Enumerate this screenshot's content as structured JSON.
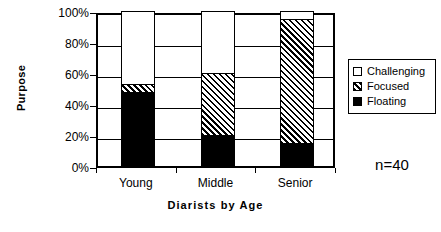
{
  "chart_data": {
    "type": "bar",
    "subtype": "stacked-100-percent",
    "title": "",
    "xlabel": "Diarists by Age",
    "ylabel": "Purpose",
    "categories": [
      "Young",
      "Middle",
      "Senior"
    ],
    "series": [
      {
        "name": "Floating",
        "values": [
          48,
          20,
          15
        ],
        "fill": "solid"
      },
      {
        "name": "Focused",
        "values": [
          5,
          40,
          80
        ],
        "fill": "hatch"
      },
      {
        "name": "Challenging",
        "values": [
          47,
          40,
          5
        ],
        "fill": "empty"
      }
    ],
    "ylim": [
      0,
      100
    ],
    "yticks": [
      0,
      20,
      40,
      60,
      80,
      100
    ],
    "ytick_labels": [
      "0%",
      "20%",
      "40%",
      "60%",
      "80%",
      "100%"
    ],
    "grid": true,
    "legend_position": "right",
    "annotation": "n=40",
    "colors": {
      "line": "#000000",
      "background": "#ffffff",
      "solid": "#000000",
      "empty": "#ffffff"
    }
  },
  "legend": {
    "items": [
      {
        "label": "Challenging",
        "fill": "empty"
      },
      {
        "label": "Focused",
        "fill": "hatch"
      },
      {
        "label": "Floating",
        "fill": "solid"
      }
    ]
  }
}
